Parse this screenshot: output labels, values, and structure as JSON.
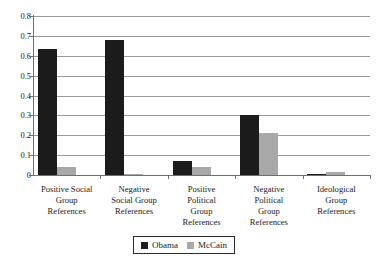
{
  "chart_data": {
    "type": "bar",
    "title": "",
    "xlabel": "",
    "ylabel": "",
    "ylim": [
      0,
      0.8
    ],
    "ytick_labels": [
      "0.8",
      "0.7",
      "0.6",
      "0.5",
      "0.4",
      "0.3",
      "0.2",
      "0.1",
      "0"
    ],
    "ytick_values": [
      0.8,
      0.7,
      0.6,
      0.5,
      0.4,
      0.3,
      0.2,
      0.1,
      0
    ],
    "grid": true,
    "legend_position": "bottom",
    "categories": [
      "Positive Social Group References",
      "Negative Social Group References",
      "Positive Political Group References",
      "Negative Political Group References",
      "Ideological Group References"
    ],
    "category_lines": [
      [
        "Positive Social",
        "Group",
        "References"
      ],
      [
        "Negative",
        "Social Group",
        "References"
      ],
      [
        "Positive",
        "Political",
        "Group",
        "References"
      ],
      [
        "Negative",
        "Political",
        "Group",
        "References"
      ],
      [
        "Ideological",
        "Group",
        "References"
      ]
    ],
    "series": [
      {
        "name": "Obama",
        "color": "#1b1b1b",
        "values": [
          0.635,
          0.68,
          0.07,
          0.3,
          0.005
        ]
      },
      {
        "name": "McCain",
        "color": "#a8a8a8",
        "values": [
          0.04,
          0.005,
          0.04,
          0.21,
          0.015
        ]
      }
    ]
  },
  "legend": {
    "entries": [
      {
        "label": "Obama",
        "color": "#1b1b1b"
      },
      {
        "label": "McCain",
        "color": "#a8a8a8"
      }
    ]
  }
}
